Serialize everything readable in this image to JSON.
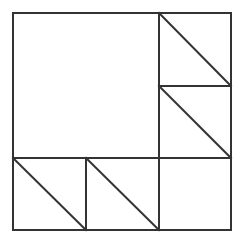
{
  "diagram": {
    "type": "geometric-tiling",
    "stroke_color": "#333333",
    "background_color": "#ffffff",
    "stroke_width": 2,
    "outer_square": {
      "x1": 13,
      "y1": 13,
      "x2": 231,
      "y2": 230
    },
    "grid": {
      "columns": 3,
      "rows": 3
    },
    "large_square": {
      "col": 0,
      "row": 0,
      "span": 2
    },
    "cells": [
      {
        "col": 2,
        "row": 0,
        "diagonal": true
      },
      {
        "col": 2,
        "row": 1,
        "diagonal": true
      },
      {
        "col": 0,
        "row": 2,
        "diagonal": true
      },
      {
        "col": 1,
        "row": 2,
        "diagonal": true
      },
      {
        "col": 2,
        "row": 2,
        "diagonal": false
      }
    ],
    "lines": [
      {
        "name": "vertical-divider-right",
        "x1": 159,
        "y1": 13,
        "x2": 159,
        "y2": 230
      },
      {
        "name": "horizontal-divider-bottom",
        "x1": 13,
        "y1": 158,
        "x2": 231,
        "y2": 158
      },
      {
        "name": "horizontal-divider-right-column",
        "x1": 159,
        "y1": 86,
        "x2": 231,
        "y2": 86
      },
      {
        "name": "vertical-divider-bottom-row",
        "x1": 86,
        "y1": 158,
        "x2": 86,
        "y2": 230
      }
    ],
    "diagonals": [
      {
        "name": "diagonal-top-right-cell",
        "x1": 159,
        "y1": 13,
        "x2": 231,
        "y2": 86
      },
      {
        "name": "diagonal-middle-right-cell",
        "x1": 159,
        "y1": 86,
        "x2": 231,
        "y2": 158
      },
      {
        "name": "diagonal-bottom-left-cell",
        "x1": 13,
        "y1": 158,
        "x2": 86,
        "y2": 230
      },
      {
        "name": "diagonal-bottom-middle-cell",
        "x1": 86,
        "y1": 158,
        "x2": 159,
        "y2": 230
      }
    ]
  }
}
